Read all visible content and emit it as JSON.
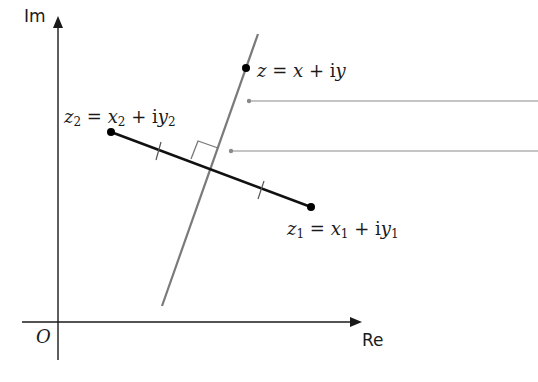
{
  "axes": {
    "x_label": "Re",
    "y_label": "Im",
    "origin_label": "O"
  },
  "points": {
    "z": {
      "label": "z = x + iy",
      "var": "z",
      "re": "x",
      "im": "y"
    },
    "z1": {
      "label": "z1 = x1 + iy1",
      "var": "z",
      "sub": "1",
      "re": "x",
      "im": "y"
    },
    "z2": {
      "label": "z2 = x2 + iy2",
      "var": "z",
      "sub": "2",
      "re": "x",
      "im": "y"
    }
  },
  "text": {
    "eq": "=",
    "plus": "+",
    "i": "i"
  },
  "colors": {
    "axis": "#1a1a1a",
    "segment": "#111111",
    "bisector": "#7a7a7a",
    "leader": "#8a8a8a"
  }
}
